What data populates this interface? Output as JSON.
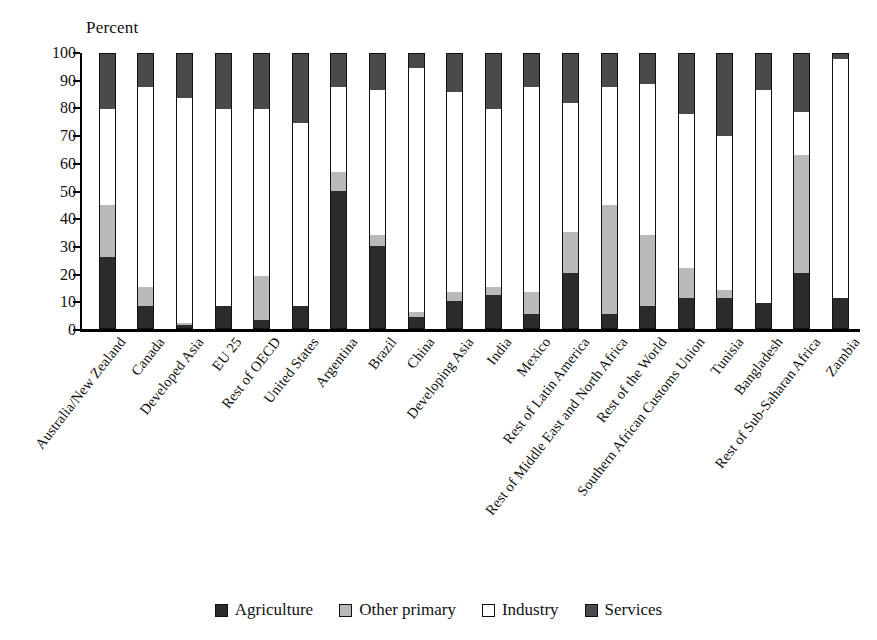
{
  "chart_data": {
    "type": "bar",
    "subtype": "stacked-bar-100",
    "title": "",
    "xlabel": "",
    "ylabel": "Percent",
    "ylim": [
      0,
      100
    ],
    "yticks": [
      0,
      10,
      20,
      30,
      40,
      50,
      60,
      70,
      80,
      90,
      100
    ],
    "grid": false,
    "legend_position": "bottom",
    "categories": [
      "Australia/New Zealand",
      "Canada",
      "Developed Asia",
      "EU 25",
      "Rest of OECD",
      "United States",
      "Argentina",
      "Brazil",
      "China",
      "Developing Asia",
      "India",
      "Mexico",
      "Rest of Latin America",
      "Rest of Middle East and North Africa",
      "Rest of the World",
      "Southern African Customs Union",
      "Tunisia",
      "Bangladesh",
      "Rest of Sub-Saharan Africa",
      "Zambia"
    ],
    "series": [
      {
        "name": "Agriculture",
        "color": "#2b2b2b",
        "values": [
          26,
          8,
          1,
          8,
          3,
          8,
          50,
          30,
          4,
          10,
          12,
          5,
          20,
          5,
          8,
          11,
          11,
          9,
          20,
          11
        ]
      },
      {
        "name": "Other primary",
        "color": "#b9b9b9",
        "values": [
          19,
          7,
          1,
          0,
          16,
          0,
          7,
          4,
          2,
          3,
          3,
          8,
          15,
          40,
          26,
          11,
          3,
          0,
          43,
          0
        ]
      },
      {
        "name": "Industry",
        "color": "#ffffff",
        "values": [
          35,
          73,
          82,
          72,
          61,
          67,
          31,
          53,
          89,
          73,
          65,
          75,
          47,
          43,
          55,
          56,
          56,
          78,
          16,
          87
        ]
      },
      {
        "name": "Services",
        "color": "#4a4a4a",
        "values": [
          20,
          12,
          16,
          20,
          20,
          25,
          12,
          13,
          5,
          14,
          20,
          12,
          18,
          12,
          11,
          22,
          30,
          13,
          21,
          2
        ]
      }
    ],
    "cumulative_tops": {
      "Australia/New Zealand": [
        26,
        45,
        80,
        100
      ],
      "Canada": [
        8,
        15,
        88,
        100
      ],
      "Developed Asia": [
        1,
        2,
        84,
        100
      ],
      "EU 25": [
        8,
        8,
        80,
        100
      ],
      "Rest of OECD": [
        3,
        19,
        80,
        100
      ],
      "United States": [
        8,
        8,
        75,
        100
      ],
      "Argentina": [
        50,
        57,
        88,
        100
      ],
      "Brazil": [
        30,
        34,
        87,
        100
      ],
      "China": [
        4,
        6,
        95,
        100
      ],
      "Developing Asia": [
        10,
        13,
        86,
        100
      ],
      "India": [
        12,
        15,
        80,
        100
      ],
      "Mexico": [
        5,
        13,
        88,
        100
      ],
      "Rest of Latin America": [
        20,
        35,
        82,
        100
      ],
      "Rest of Middle East and North Africa": [
        5,
        45,
        88,
        100
      ],
      "Rest of the World": [
        8,
        34,
        89,
        100
      ],
      "Southern African Customs Union": [
        11,
        22,
        78,
        100
      ],
      "Tunisia": [
        11,
        14,
        70,
        100
      ],
      "Bangladesh": [
        9,
        9,
        87,
        100
      ],
      "Rest of Sub-Saharan Africa": [
        20,
        63,
        79,
        100
      ],
      "Zambia": [
        11,
        11,
        98,
        100
      ]
    }
  },
  "legend": {
    "items": [
      {
        "label": "Agriculture",
        "swatch": "swatch-agriculture"
      },
      {
        "label": "Other primary",
        "swatch": "swatch-other-primary"
      },
      {
        "label": "Industry",
        "swatch": "swatch-industry"
      },
      {
        "label": "Services",
        "swatch": "swatch-services"
      }
    ]
  },
  "axis": {
    "y_title": "Percent"
  }
}
